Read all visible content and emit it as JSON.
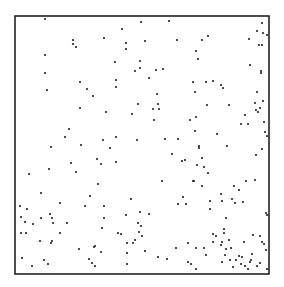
{
  "chart_data": {
    "type": "scatter",
    "title": "",
    "xlabel": "",
    "ylabel": "",
    "grid": false,
    "legend": null,
    "frame": {
      "left": 15,
      "top": 16,
      "right": 269,
      "bottom": 274
    },
    "colors": {
      "frame": "#222222",
      "point": "#222222",
      "background": "#ffffff"
    },
    "coordinate_system": "pixel (image space)",
    "points": [
      [
        45,
        19
      ],
      [
        73,
        40
      ],
      [
        73,
        44
      ],
      [
        76,
        47
      ],
      [
        45,
        55
      ],
      [
        45,
        73
      ],
      [
        80,
        82
      ],
      [
        47,
        90
      ],
      [
        87,
        89
      ],
      [
        93,
        96
      ],
      [
        141,
        22
      ],
      [
        169,
        21
      ],
      [
        122,
        29
      ],
      [
        104,
        38
      ],
      [
        126,
        43
      ],
      [
        145,
        41
      ],
      [
        177,
        40
      ],
      [
        126,
        49
      ],
      [
        115,
        62
      ],
      [
        140,
        61
      ],
      [
        140,
        68
      ],
      [
        135,
        71
      ],
      [
        156,
        70
      ],
      [
        163,
        69
      ],
      [
        149,
        78
      ],
      [
        116,
        80
      ],
      [
        116,
        87
      ],
      [
        157,
        94
      ],
      [
        262,
        23
      ],
      [
        257,
        31
      ],
      [
        263,
        33
      ],
      [
        267,
        35
      ],
      [
        208,
        36
      ],
      [
        202,
        40
      ],
      [
        249,
        39
      ],
      [
        259,
        45
      ],
      [
        262,
        45
      ],
      [
        196,
        51
      ],
      [
        198,
        59
      ],
      [
        250,
        65
      ],
      [
        261,
        71
      ],
      [
        261,
        73
      ],
      [
        193,
        82
      ],
      [
        206,
        82
      ],
      [
        213,
        81
      ],
      [
        221,
        85
      ],
      [
        223,
        88
      ],
      [
        195,
        92
      ],
      [
        257,
        92
      ],
      [
        80,
        108
      ],
      [
        69,
        129
      ],
      [
        65,
        137
      ],
      [
        51,
        147
      ],
      [
        81,
        145
      ],
      [
        97,
        159
      ],
      [
        71,
        163
      ],
      [
        29,
        174
      ],
      [
        49,
        169
      ],
      [
        76,
        172
      ],
      [
        138,
        104
      ],
      [
        158,
        104
      ],
      [
        153,
        109
      ],
      [
        159,
        109
      ],
      [
        106,
        112
      ],
      [
        132,
        114
      ],
      [
        154,
        120
      ],
      [
        103,
        140
      ],
      [
        116,
        137
      ],
      [
        137,
        140
      ],
      [
        165,
        139
      ],
      [
        178,
        139
      ],
      [
        110,
        148
      ],
      [
        172,
        154
      ],
      [
        101,
        164
      ],
      [
        116,
        162
      ],
      [
        182,
        161
      ],
      [
        162,
        181
      ],
      [
        98,
        184
      ],
      [
        207,
        105
      ],
      [
        229,
        105
      ],
      [
        255,
        103
      ],
      [
        263,
        101
      ],
      [
        256,
        110
      ],
      [
        258,
        112
      ],
      [
        260,
        108
      ],
      [
        245,
        115
      ],
      [
        190,
        120
      ],
      [
        196,
        117
      ],
      [
        241,
        124
      ],
      [
        248,
        124
      ],
      [
        264,
        122
      ],
      [
        195,
        131
      ],
      [
        217,
        134
      ],
      [
        265,
        132
      ],
      [
        267,
        136
      ],
      [
        199,
        146
      ],
      [
        227,
        146
      ],
      [
        199,
        148
      ],
      [
        262,
        149
      ],
      [
        256,
        155
      ],
      [
        185,
        160
      ],
      [
        202,
        158
      ],
      [
        197,
        165
      ],
      [
        204,
        167
      ],
      [
        208,
        173
      ],
      [
        194,
        181
      ],
      [
        246,
        181
      ],
      [
        255,
        180
      ],
      [
        41,
        193
      ],
      [
        60,
        203
      ],
      [
        90,
        196
      ],
      [
        85,
        206
      ],
      [
        20,
        206
      ],
      [
        27,
        209
      ],
      [
        21,
        217
      ],
      [
        25,
        222
      ],
      [
        41,
        218
      ],
      [
        33,
        224
      ],
      [
        50,
        214
      ],
      [
        52,
        218
      ],
      [
        53,
        223
      ],
      [
        67,
        223
      ],
      [
        21,
        233
      ],
      [
        26,
        233
      ],
      [
        60,
        233
      ],
      [
        52,
        241
      ],
      [
        40,
        241
      ],
      [
        51,
        243
      ],
      [
        79,
        249
      ],
      [
        94,
        247
      ],
      [
        22,
        258
      ],
      [
        44,
        260
      ],
      [
        89,
        259
      ],
      [
        92,
        263
      ],
      [
        48,
        264
      ],
      [
        32,
        266
      ],
      [
        95,
        266
      ],
      [
        131,
        199
      ],
      [
        104,
        206
      ],
      [
        178,
        204
      ],
      [
        183,
        197
      ],
      [
        104,
        218
      ],
      [
        126,
        215
      ],
      [
        140,
        212
      ],
      [
        149,
        214
      ],
      [
        102,
        228
      ],
      [
        138,
        223
      ],
      [
        141,
        226
      ],
      [
        139,
        232
      ],
      [
        118,
        233
      ],
      [
        121,
        234
      ],
      [
        142,
        236
      ],
      [
        135,
        240
      ],
      [
        127,
        243
      ],
      [
        133,
        243
      ],
      [
        95,
        246
      ],
      [
        101,
        252
      ],
      [
        145,
        251
      ],
      [
        158,
        257
      ],
      [
        167,
        259
      ],
      [
        176,
        248
      ],
      [
        127,
        253
      ],
      [
        127,
        264
      ],
      [
        193,
        181
      ],
      [
        202,
        186
      ],
      [
        234,
        186
      ],
      [
        221,
        194
      ],
      [
        239,
        190
      ],
      [
        186,
        204
      ],
      [
        210,
        201
      ],
      [
        222,
        201
      ],
      [
        232,
        199
      ],
      [
        235,
        203
      ],
      [
        243,
        202
      ],
      [
        210,
        209
      ],
      [
        266,
        213
      ],
      [
        267,
        215
      ],
      [
        226,
        218
      ],
      [
        224,
        229
      ],
      [
        213,
        234
      ],
      [
        224,
        233
      ],
      [
        216,
        236
      ],
      [
        253,
        235
      ],
      [
        260,
        236
      ],
      [
        229,
        240
      ],
      [
        188,
        243
      ],
      [
        213,
        242
      ],
      [
        222,
        242
      ],
      [
        244,
        242
      ],
      [
        262,
        242
      ],
      [
        264,
        244
      ],
      [
        196,
        248
      ],
      [
        204,
        248
      ],
      [
        221,
        245
      ],
      [
        226,
        249
      ],
      [
        231,
        248
      ],
      [
        266,
        250
      ],
      [
        206,
        255
      ],
      [
        225,
        255
      ],
      [
        239,
        256
      ],
      [
        242,
        257
      ],
      [
        252,
        254
      ],
      [
        251,
        260
      ],
      [
        188,
        262
      ],
      [
        191,
        264
      ],
      [
        222,
        262
      ],
      [
        230,
        260
      ],
      [
        236,
        260
      ],
      [
        250,
        262
      ],
      [
        257,
        266
      ],
      [
        260,
        263
      ],
      [
        241,
        264
      ],
      [
        245,
        266
      ],
      [
        196,
        269
      ],
      [
        248,
        269
      ],
      [
        233,
        267
      ],
      [
        267,
        269
      ]
    ]
  }
}
